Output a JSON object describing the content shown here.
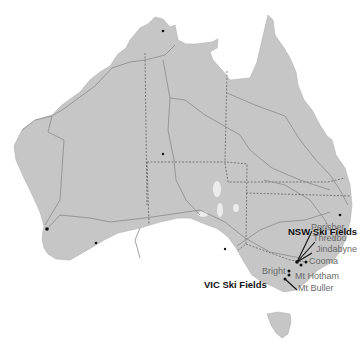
{
  "map": {
    "title": "Australia Ski Fields",
    "colors": {
      "land": "#c6c6c6",
      "border": "#555555",
      "road": "#8a8a8a",
      "dot": "#111111",
      "water": "#ffffff"
    },
    "region_labels": [
      {
        "name": "NSW Ski Fields",
        "x": 288,
        "y": 232
      },
      {
        "name": "VIC Ski Fields",
        "x": 204,
        "y": 285
      }
    ],
    "places": [
      {
        "name": "Perisher",
        "x": 311,
        "y": 227
      },
      {
        "name": "Thredbo",
        "x": 313,
        "y": 238
      },
      {
        "name": "Jindabyne",
        "x": 316,
        "y": 249
      },
      {
        "name": "Cooma",
        "x": 315,
        "y": 261
      },
      {
        "name": "Bright",
        "x": 263,
        "y": 270
      },
      {
        "name": "Mt Hotham",
        "x": 296,
        "y": 275
      },
      {
        "name": "Mt Buller",
        "x": 298,
        "y": 287
      }
    ]
  }
}
